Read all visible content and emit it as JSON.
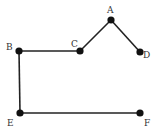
{
  "diagram": {
    "nodes": [
      {
        "id": "A",
        "label": "A",
        "x": 111,
        "y": 20,
        "lx": 107,
        "ly": 13
      },
      {
        "id": "B",
        "label": "B",
        "x": 19,
        "y": 51,
        "lx": 6,
        "ly": 50
      },
      {
        "id": "C",
        "label": "C",
        "x": 80,
        "y": 51,
        "lx": 71,
        "ly": 47
      },
      {
        "id": "D",
        "label": "D",
        "x": 140,
        "y": 52,
        "lx": 143,
        "ly": 58
      },
      {
        "id": "E",
        "label": "E",
        "x": 20,
        "y": 113,
        "lx": 7,
        "ly": 126
      },
      {
        "id": "F",
        "label": "F",
        "x": 140,
        "y": 113,
        "lx": 144,
        "ly": 126
      }
    ],
    "edges": [
      {
        "from": "B",
        "to": "C"
      },
      {
        "from": "C",
        "to": "A"
      },
      {
        "from": "A",
        "to": "D"
      },
      {
        "from": "B",
        "to": "E"
      },
      {
        "from": "E",
        "to": "F"
      }
    ],
    "colors": {
      "edge": "#222222",
      "node": "#111111",
      "label": "#333333"
    }
  }
}
